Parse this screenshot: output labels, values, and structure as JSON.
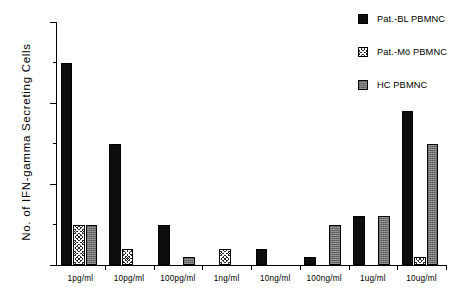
{
  "chart_data": {
    "type": "bar",
    "title": "",
    "xlabel": "",
    "ylabel": "No. of IFN-gamma  Secreting  Cells",
    "ylim": [
      0,
      30
    ],
    "yticks": [
      0,
      10,
      20,
      30
    ],
    "ytick_labels": [
      "0",
      "10",
      "20",
      "30"
    ],
    "yminor_ticks": [
      5,
      15,
      25
    ],
    "grid": false,
    "legend_position": "top-right",
    "categories": [
      "1pg/ml",
      "10pg/ml",
      "100pg/ml",
      "1ng/ml",
      "10ng/ml",
      "100ng/ml",
      "1ug/ml",
      "10ug/ml"
    ],
    "series": [
      {
        "name": "Pat.-BL PBMNC",
        "fill": "solid",
        "values": [
          25,
          15,
          5,
          0,
          2,
          1,
          6,
          19
        ]
      },
      {
        "name": "Pat.-Mö PBMNC",
        "fill": "hatch",
        "values": [
          5,
          2,
          0,
          2,
          0,
          0,
          0,
          1
        ]
      },
      {
        "name": "HC PBMNC",
        "fill": "gray",
        "values": [
          5,
          0,
          1,
          0,
          0,
          5,
          6,
          15
        ]
      }
    ]
  },
  "legend": {
    "items": [
      {
        "label": "Pat.-BL PBMNC",
        "fill": "solid"
      },
      {
        "label": "Pat.-Mö PBMNC",
        "fill": "hatch"
      },
      {
        "label": "HC PBMNC",
        "fill": "gray"
      }
    ]
  }
}
